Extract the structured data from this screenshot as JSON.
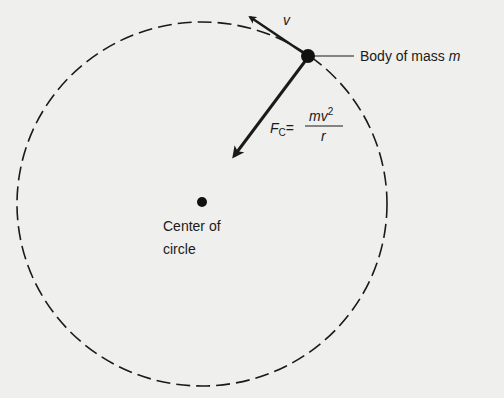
{
  "diagram": {
    "circle": {
      "cx": 202,
      "cy": 204,
      "rx": 185,
      "ry": 182,
      "style": "dashed",
      "color": "#1a1a1a"
    },
    "body": {
      "x": 308,
      "y": 56,
      "r": 7,
      "label_prefix": "Body of mass ",
      "label_var": "m"
    },
    "velocity": {
      "label": "v",
      "from": [
        308,
        56
      ],
      "to": [
        247,
        15
      ]
    },
    "force": {
      "label_F": "F",
      "label_sub": "C",
      "equals": "=",
      "numerator": "mv",
      "numerator_exp": "2",
      "denominator": "r",
      "from": [
        308,
        56
      ],
      "to": [
        231,
        160
      ]
    },
    "center": {
      "x": 202,
      "y": 202,
      "r": 5,
      "label_line1": "Center of",
      "label_line2": "circle"
    }
  }
}
